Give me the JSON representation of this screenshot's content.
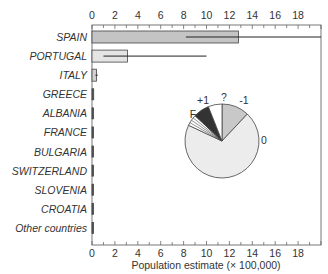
{
  "chart_data": {
    "type": "bar",
    "orientation": "horizontal",
    "title": "",
    "xlabel": "Population estimate (× 100,000)",
    "ylabel": "",
    "xlim": [
      0,
      20
    ],
    "xticks": [
      "0",
      "2",
      "4",
      "6",
      "8",
      "10",
      "12",
      "14",
      "16",
      "18"
    ],
    "categories": [
      "SPAIN",
      "PORTUGAL",
      "ITALY",
      "GREECE",
      "ALBANIA",
      "FRANCE",
      "BULGARIA",
      "SWITZERLAND",
      "SLOVENIA",
      "CROATIA",
      "Other countries"
    ],
    "values": [
      12.8,
      3.1,
      0.4,
      0.15,
      0.1,
      0.08,
      0.06,
      0.05,
      0.04,
      0.04,
      0.03
    ],
    "error_low": [
      8.2,
      1.0,
      0.3,
      null,
      null,
      null,
      null,
      null,
      null,
      null,
      null
    ],
    "error_high": [
      20.5,
      10.0,
      0.5,
      null,
      null,
      null,
      null,
      null,
      null,
      null,
      null
    ],
    "bar_colors": {
      "SPAIN": "#c4c4c4",
      "PORTUGAL": "#e4e4e4",
      "ITALY": "#d0d0d0",
      "default": "#555555"
    },
    "grid": false,
    "inset_pie": {
      "type": "pie",
      "labels": [
        "-1",
        "0",
        "F",
        "+1",
        "?"
      ],
      "values": [
        12,
        70,
        5,
        7,
        6
      ],
      "colors": [
        "#c8c8c8",
        "#ececec",
        "#ffffff",
        "#333333",
        "#ffffff"
      ]
    }
  }
}
